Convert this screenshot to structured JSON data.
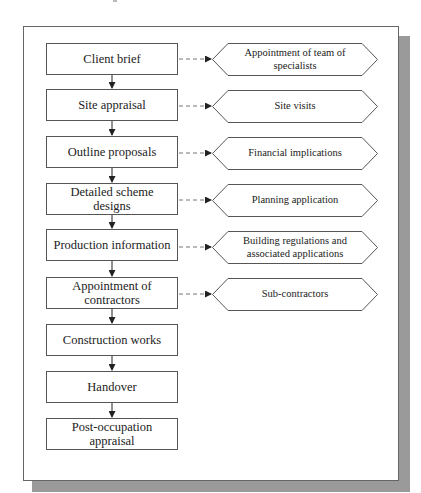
{
  "diagram": {
    "type": "flowchart",
    "main_steps": [
      {
        "label": "Client brief"
      },
      {
        "label": "Site appraisal"
      },
      {
        "label": "Outline proposals"
      },
      {
        "label": "Detailed scheme\ndesigns"
      },
      {
        "label": "Production information"
      },
      {
        "label": "Appointment of\ncontractors"
      },
      {
        "label": "Construction works"
      },
      {
        "label": "Handover"
      },
      {
        "label": "Post-occupation\nappraisal"
      }
    ],
    "side_steps": [
      {
        "label": "Appointment of team of\nspecialists",
        "links_from": 0
      },
      {
        "label": "Site visits",
        "links_from": 1
      },
      {
        "label": "Financial implications",
        "links_from": 2
      },
      {
        "label": "Planning application",
        "links_from": 3
      },
      {
        "label": "Building regulations and\nassociated applications",
        "links_from": 4
      },
      {
        "label": "Sub-contractors",
        "links_from": 5
      }
    ],
    "colors": {
      "frame_border": "#666666",
      "shadow": "#9a9a9a",
      "box_border": "#555555",
      "arrow": "#222222",
      "dashed": "#777777"
    }
  }
}
